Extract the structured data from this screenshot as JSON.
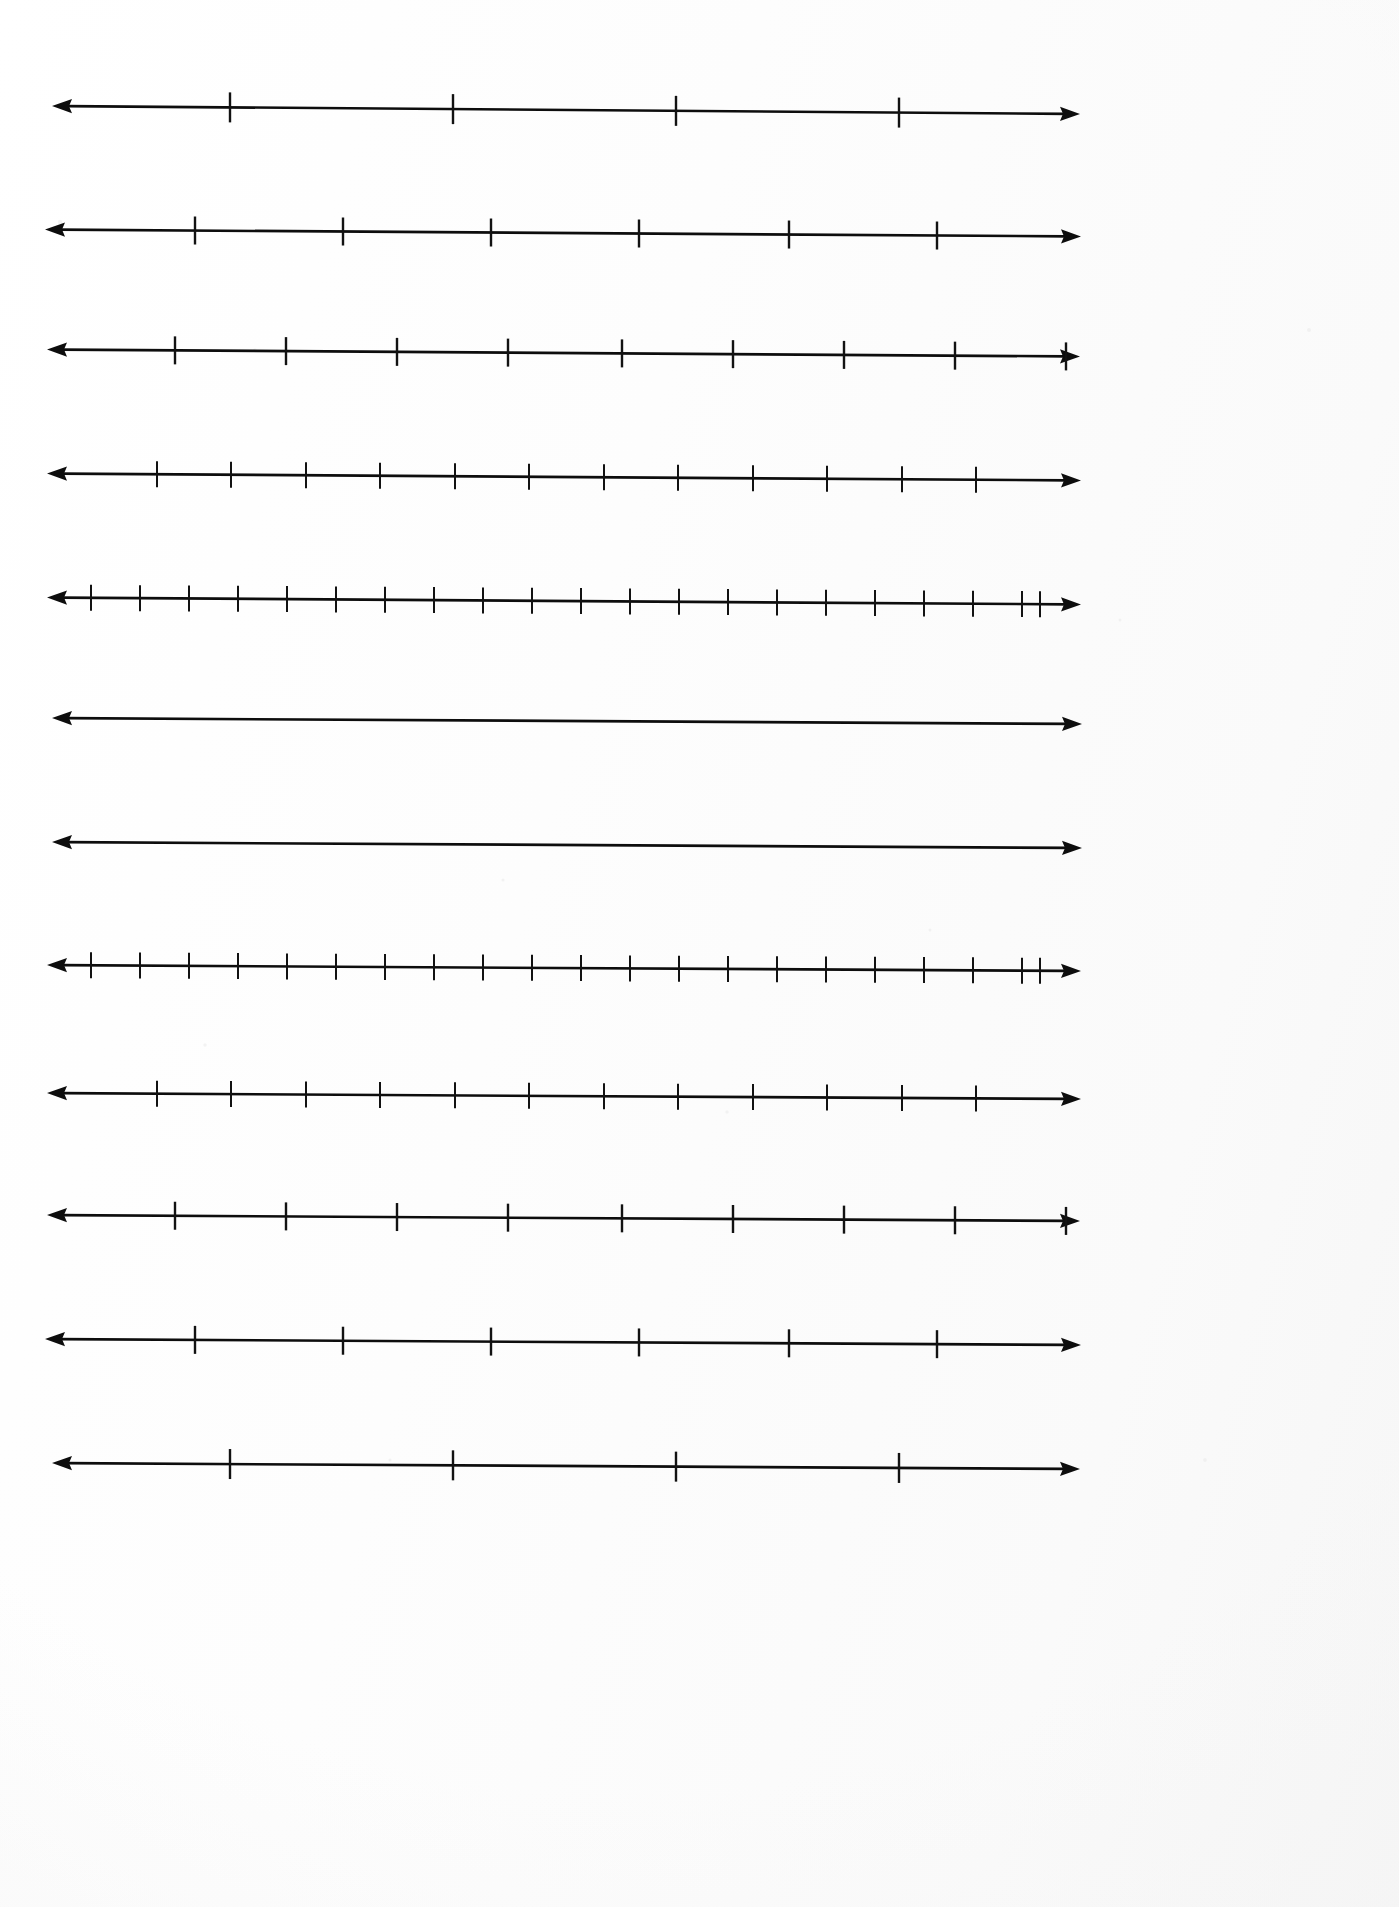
{
  "document": {
    "title": "Blank Number Lines Worksheet",
    "page_type": "worksheet",
    "orientation": "portrait",
    "background_color": "#fdfdfd",
    "ink_color": "#0d0d0d",
    "line_count": "12",
    "description": "Scanned blank worksheet page of twelve horizontal double-ended number lines with evenly spaced unlabeled tick marks"
  },
  "chart_data": {
    "type": "line",
    "subtitle": "",
    "xlabel": "",
    "ylabel": "",
    "grid": false,
    "legend": "none",
    "axis_style": "double-headed arrow",
    "tick_labels_shown": "none",
    "lines": [
      {
        "index": "1",
        "label": "number-line-1",
        "y_center": 110,
        "x_start": 52,
        "x_end": 1080,
        "slope_drop_px": 8,
        "tick_count": 4,
        "tick_spacing_px": 223,
        "first_tick_x": 230,
        "tick_half_height": 15,
        "tick_positions": [
          230,
          453,
          676,
          899
        ]
      },
      {
        "index": "2",
        "label": "number-line-2",
        "y_center": 233,
        "x_start": 45,
        "x_end": 1081,
        "slope_drop_px": 7,
        "tick_count": 6,
        "tick_spacing_px": 148,
        "first_tick_x": 195,
        "tick_half_height": 14,
        "tick_positions": [
          195,
          343,
          491,
          639,
          789,
          937
        ]
      },
      {
        "index": "3",
        "label": "number-line-3",
        "y_center": 353,
        "x_start": 47,
        "x_end": 1080,
        "slope_drop_px": 7,
        "tick_count": 9,
        "tick_spacing_px": 111,
        "first_tick_x": 175,
        "tick_half_height": 14,
        "tick_positions": [
          175,
          286,
          397,
          508,
          622,
          733,
          844,
          955,
          1066
        ]
      },
      {
        "index": "4",
        "label": "number-line-4",
        "y_center": 477,
        "x_start": 47,
        "x_end": 1081,
        "slope_drop_px": 7,
        "tick_count": 12,
        "tick_spacing_px": 82,
        "first_tick_x": 157,
        "tick_half_height": 13,
        "tick_positions": [
          157,
          231,
          306,
          380,
          455,
          529,
          604,
          678,
          753,
          827,
          902,
          976
        ]
      },
      {
        "index": "5",
        "label": "number-line-5",
        "y_center": 601,
        "x_start": 47,
        "x_end": 1081,
        "slope_drop_px": 7,
        "tick_count": 21,
        "tick_spacing_px": 49,
        "first_tick_x": 91,
        "tick_half_height": 13,
        "tick_positions": [
          91,
          140,
          189,
          238,
          287,
          336,
          385,
          434,
          483,
          532,
          581,
          630,
          679,
          728,
          777,
          826,
          875,
          924,
          973,
          1022,
          1040
        ]
      },
      {
        "index": "6",
        "label": "number-line-6",
        "y_center": 721,
        "x_start": 52,
        "x_end": 1082,
        "slope_drop_px": 6,
        "tick_count": 0,
        "tick_spacing_px": 0,
        "first_tick_x": 0,
        "tick_half_height": 0,
        "tick_positions": []
      },
      {
        "index": "7",
        "label": "number-line-7",
        "y_center": 845,
        "x_start": 52,
        "x_end": 1082,
        "slope_drop_px": 6,
        "tick_count": 0,
        "tick_spacing_px": 0,
        "first_tick_x": 0,
        "tick_half_height": 0,
        "tick_positions": []
      },
      {
        "index": "8",
        "label": "number-line-8",
        "y_center": 968,
        "x_start": 47,
        "x_end": 1081,
        "slope_drop_px": 6,
        "tick_count": 21,
        "tick_spacing_px": 49,
        "first_tick_x": 91,
        "tick_half_height": 13,
        "tick_positions": [
          91,
          140,
          189,
          238,
          287,
          336,
          385,
          434,
          483,
          532,
          581,
          630,
          679,
          728,
          777,
          826,
          875,
          924,
          973,
          1022,
          1040
        ]
      },
      {
        "index": "9",
        "label": "number-line-9",
        "y_center": 1096,
        "x_start": 47,
        "x_end": 1081,
        "slope_drop_px": 6,
        "tick_count": 12,
        "tick_spacing_px": 82,
        "first_tick_x": 157,
        "tick_half_height": 13,
        "tick_positions": [
          157,
          231,
          306,
          380,
          455,
          529,
          604,
          678,
          753,
          827,
          902,
          976
        ]
      },
      {
        "index": "10",
        "label": "number-line-10",
        "y_center": 1218,
        "x_start": 47,
        "x_end": 1080,
        "slope_drop_px": 6,
        "tick_count": 9,
        "tick_spacing_px": 111,
        "first_tick_x": 175,
        "tick_half_height": 14,
        "tick_positions": [
          175,
          286,
          397,
          508,
          622,
          733,
          844,
          955,
          1066
        ]
      },
      {
        "index": "11",
        "label": "number-line-11",
        "y_center": 1342,
        "x_start": 45,
        "x_end": 1081,
        "slope_drop_px": 6,
        "tick_count": 6,
        "tick_spacing_px": 148,
        "first_tick_x": 195,
        "tick_half_height": 14,
        "tick_positions": [
          195,
          343,
          491,
          639,
          789,
          937
        ]
      },
      {
        "index": "12",
        "label": "number-line-12",
        "y_center": 1466,
        "x_start": 52,
        "x_end": 1080,
        "slope_drop_px": 6,
        "tick_count": 4,
        "tick_spacing_px": 223,
        "first_tick_x": 230,
        "tick_half_height": 15,
        "tick_positions": [
          230,
          453,
          676,
          899
        ]
      }
    ]
  }
}
